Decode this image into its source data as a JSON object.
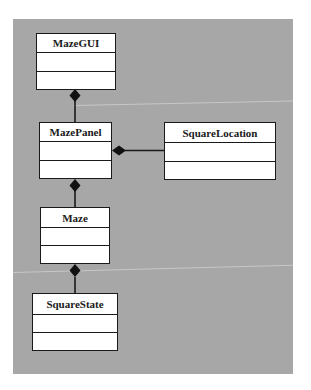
{
  "diagram": {
    "type": "UML class diagram",
    "background_color": "#a7a7a7",
    "classes": [
      {
        "id": "mazegui",
        "name": "MazeGUI"
      },
      {
        "id": "mazepanel",
        "name": "MazePanel"
      },
      {
        "id": "squarelocation",
        "name": "SquareLocation"
      },
      {
        "id": "maze",
        "name": "Maze"
      },
      {
        "id": "squarestate",
        "name": "SquareState"
      }
    ],
    "relationships": [
      {
        "type": "composition",
        "whole": "MazeGUI",
        "part": "MazePanel"
      },
      {
        "type": "composition",
        "whole": "MazePanel",
        "part": "SquareLocation"
      },
      {
        "type": "composition",
        "whole": "MazePanel",
        "part": "Maze"
      },
      {
        "type": "composition",
        "whole": "Maze",
        "part": "SquareState"
      }
    ]
  }
}
